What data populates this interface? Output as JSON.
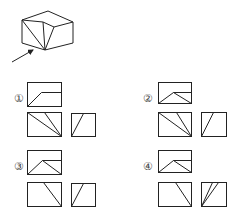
{
  "question": {
    "header_text_cropped": "",
    "figure": {
      "name": "3d-solid",
      "polylines": [
        [
          [
            22,
            20
          ],
          [
            48,
            11
          ],
          [
            73,
            22
          ]
        ],
        [
          [
            22,
            20
          ],
          [
            43,
            22
          ],
          [
            54,
            27
          ],
          [
            73,
            22
          ]
        ],
        [
          [
            22,
            20
          ],
          [
            22,
            43
          ],
          [
            45,
            50
          ],
          [
            73,
            43
          ],
          [
            73,
            22
          ]
        ],
        [
          [
            22,
            20
          ],
          [
            45,
            50
          ]
        ],
        [
          [
            43,
            22
          ],
          [
            45,
            50
          ]
        ],
        [
          [
            54,
            27
          ],
          [
            45,
            50
          ]
        ]
      ],
      "arrow": {
        "from": [
          12,
          62
        ],
        "to": [
          33,
          50
        ]
      }
    }
  },
  "options": [
    {
      "label": "①",
      "label_pos": [
        14,
        98
      ],
      "views": [
        {
          "name": "top-view",
          "rect": [
            27,
            82,
            34,
            24
          ],
          "lines": [
            [
              [
                27,
                106
              ],
              [
                41,
                92
              ],
              [
                61,
                92
              ]
            ]
          ]
        },
        {
          "name": "front-view",
          "rect": [
            27,
            112,
            34,
            24
          ],
          "lines": [
            [
              [
                27,
                112
              ],
              [
                61,
                136
              ]
            ],
            [
              [
                44,
                112
              ],
              [
                61,
                136
              ]
            ]
          ]
        },
        {
          "name": "side-view",
          "rect": [
            71,
            113,
            24,
            23
          ],
          "lines": [
            [
              [
                71,
                136
              ],
              [
                83,
                113
              ]
            ]
          ]
        }
      ]
    },
    {
      "label": "②",
      "label_pos": [
        143,
        98
      ],
      "views": [
        {
          "name": "top-view",
          "rect": [
            158,
            82,
            33,
            21
          ],
          "lines": [
            [
              [
                158,
                103
              ],
              [
                173,
                92
              ],
              [
                191,
                103
              ]
            ],
            [
              [
                173,
                92
              ],
              [
                191,
                92
              ]
            ]
          ]
        },
        {
          "name": "front-view",
          "rect": [
            158,
            112,
            33,
            24
          ],
          "lines": [
            [
              [
                158,
                112
              ],
              [
                191,
                136
              ]
            ],
            [
              [
                176,
                112
              ],
              [
                191,
                136
              ]
            ]
          ]
        },
        {
          "name": "side-view",
          "rect": [
            201,
            112,
            25,
            24
          ],
          "lines": [
            [
              [
                201,
                136
              ],
              [
                213,
                112
              ]
            ]
          ]
        }
      ]
    },
    {
      "label": "③",
      "label_pos": [
        14,
        166
      ],
      "views": [
        {
          "name": "top-view",
          "rect": [
            27,
            150,
            34,
            24
          ],
          "lines": [
            [
              [
                27,
                174
              ],
              [
                42,
                160
              ],
              [
                61,
                174
              ]
            ],
            [
              [
                42,
                160
              ],
              [
                61,
                160
              ]
            ]
          ]
        },
        {
          "name": "front-view",
          "rect": [
            27,
            182,
            34,
            24
          ],
          "lines": [
            [
              [
                43,
                182
              ],
              [
                61,
                206
              ]
            ]
          ]
        },
        {
          "name": "side-view",
          "rect": [
            71,
            183,
            24,
            23
          ],
          "lines": [
            [
              [
                71,
                206
              ],
              [
                83,
                183
              ]
            ]
          ]
        }
      ]
    },
    {
      "label": "④",
      "label_pos": [
        143,
        166
      ],
      "views": [
        {
          "name": "top-view",
          "rect": [
            158,
            150,
            33,
            22
          ],
          "lines": [
            [
              [
                158,
                172
              ],
              [
                173,
                160
              ],
              [
                191,
                172
              ]
            ],
            [
              [
                173,
                160
              ],
              [
                191,
                160
              ]
            ]
          ]
        },
        {
          "name": "front-view",
          "rect": [
            158,
            182,
            33,
            24
          ],
          "lines": [
            [
              [
                175,
                182
              ],
              [
                191,
                206
              ]
            ]
          ]
        },
        {
          "name": "side-view",
          "rect": [
            201,
            182,
            25,
            24
          ],
          "lines": [
            [
              [
                201,
                206
              ],
              [
                212,
                182
              ]
            ],
            [
              [
                201,
                206
              ],
              [
                218,
                182
              ]
            ]
          ]
        }
      ]
    }
  ]
}
